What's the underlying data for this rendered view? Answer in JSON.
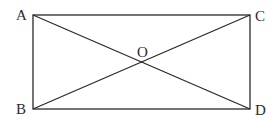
{
  "diagram": {
    "type": "geometry",
    "shape": "rectangle with diagonals",
    "points": {
      "A": {
        "label": "A",
        "x": 33,
        "y": 15
      },
      "B": {
        "label": "B",
        "x": 33,
        "y": 109
      },
      "C": {
        "label": "C",
        "x": 250,
        "y": 15
      },
      "D": {
        "label": "D",
        "x": 250,
        "y": 109
      },
      "O": {
        "label": "O",
        "x": 141.5,
        "y": 62
      }
    },
    "segments": [
      "AC",
      "CD",
      "DB",
      "BA",
      "AD",
      "BC"
    ],
    "colors": {
      "stroke": "#2a2a2a",
      "background": "#ffffff"
    }
  }
}
